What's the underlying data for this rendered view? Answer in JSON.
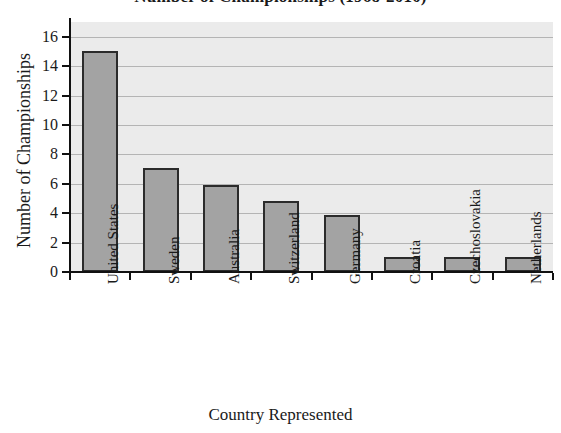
{
  "chart_data": {
    "type": "bar",
    "title": "Number of Championships (1968-2010)",
    "xlabel": "Country Represented",
    "ylabel": "Number of Championships",
    "categories": [
      "United States",
      "Sweden",
      "Australia",
      "Switzerland",
      "Germany",
      "Croatia",
      "Czechoslovakia",
      "Netherlands"
    ],
    "values": [
      15,
      7.1,
      5.9,
      4.8,
      3.9,
      1,
      1,
      1
    ],
    "ylim": [
      0,
      17
    ],
    "yticks": [
      0,
      2,
      4,
      6,
      8,
      10,
      12,
      14,
      16
    ],
    "ytick_labels": [
      "0",
      "2",
      "4",
      "6",
      "8",
      "10",
      "12",
      "14",
      "16"
    ],
    "grid": true,
    "legend": false,
    "bar_color": "#a3a3a3",
    "bar_edge_color": "#2b2b2b",
    "plot_background": "#ebebeb",
    "gridline_color": "#b4b4b4",
    "axis_color": "#111111"
  }
}
